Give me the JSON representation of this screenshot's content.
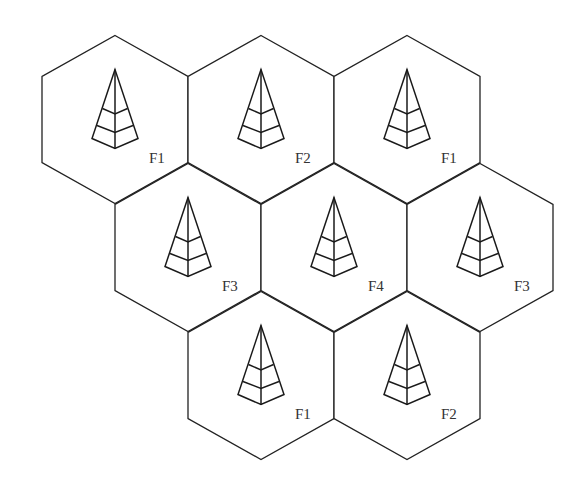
{
  "diagram": {
    "layout": "honeycomb, 3 rows (3, 3, 2 cells)",
    "cells": [
      {
        "row": 0,
        "col": 0,
        "label": "F1",
        "icon": "cell-tower-icon"
      },
      {
        "row": 0,
        "col": 1,
        "label": "F2",
        "icon": "cell-tower-icon"
      },
      {
        "row": 0,
        "col": 2,
        "label": "F1",
        "icon": "cell-tower-icon"
      },
      {
        "row": 1,
        "col": 0,
        "label": "F3",
        "icon": "cell-tower-icon"
      },
      {
        "row": 1,
        "col": 1,
        "label": "F4",
        "icon": "cell-tower-icon"
      },
      {
        "row": 1,
        "col": 2,
        "label": "F3",
        "icon": "cell-tower-icon"
      },
      {
        "row": 2,
        "col": 0,
        "label": "F1",
        "icon": "cell-tower-icon"
      },
      {
        "row": 2,
        "col": 1,
        "label": "F2",
        "icon": "cell-tower-icon"
      }
    ],
    "colors": {
      "stroke": "#222222",
      "label": "#333333",
      "background": "#ffffff"
    }
  }
}
